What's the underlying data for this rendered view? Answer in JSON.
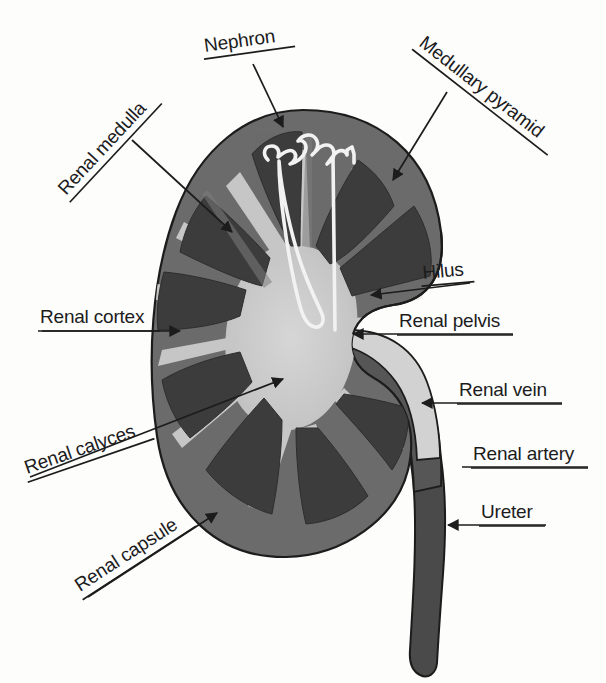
{
  "figure": {
    "type": "anatomical-diagram",
    "background_color": "#fdfdfc"
  },
  "palette": {
    "cortex": "#6b6b6b",
    "medullary_pyramid": "#3c3c3c",
    "renal_pelvis": "#c9c9c9",
    "renal_column": "#7a7a7a",
    "vessel_dark": "#4a4a4a",
    "vessel_light": "#d2d2d2",
    "outline": "#1c1c1c",
    "nephron_outline": "#f2f2f2",
    "label_text": "#1c1c1c",
    "ghost_text": "#efece6"
  },
  "background_ghost_text": [
    {
      "text": "Studies",
      "x": 206,
      "y": 236
    },
    {
      "text": "with Cells",
      "x": 196,
      "y": 300
    },
    {
      "text": "s Cells",
      "x": 200,
      "y": 500
    }
  ],
  "labels": [
    {
      "id": "nephron",
      "text": "Nephron",
      "x": 205,
      "y": 52,
      "rotation": -8,
      "underline_width": 92,
      "anchor": "start",
      "arrow_to_x": 283,
      "arrow_to_y": 127,
      "has_arrow": true
    },
    {
      "id": "medullary-pyramid",
      "text": "Medullary pyramid",
      "x": 418,
      "y": 45,
      "rotation": 38,
      "underline_width": 172,
      "anchor": "start",
      "arrow_to_x": 393,
      "arrow_to_y": 180,
      "has_arrow": true
    },
    {
      "id": "renal-medulla",
      "text": "Renal medulla",
      "x": 66,
      "y": 196,
      "rotation": -47,
      "underline_width": 135,
      "anchor": "start",
      "arrow_to_x": 232,
      "arrow_to_y": 232,
      "has_arrow": true
    },
    {
      "id": "renal-cortex",
      "text": "Renal cortex",
      "x": 40,
      "y": 323,
      "rotation": 0,
      "underline_width": 122,
      "anchor": "start",
      "arrow_to_x": 180,
      "arrow_to_y": 331,
      "has_arrow": true
    },
    {
      "id": "renal-calyces",
      "text": "Renal calyces",
      "x": 27,
      "y": 474,
      "rotation": -19,
      "underline_width": 134,
      "anchor": "start",
      "arrow_to_x": 283,
      "arrow_to_y": 379,
      "has_arrow": true
    },
    {
      "id": "renal-capsule",
      "text": "Renal capsule",
      "x": 80,
      "y": 592,
      "rotation": -33,
      "underline_width": 135,
      "anchor": "start",
      "arrow_to_x": 217,
      "arrow_to_y": 513,
      "has_arrow": true
    },
    {
      "id": "hilus",
      "text": "Hilus",
      "x": 423,
      "y": 279,
      "rotation": -5,
      "underline_width": 53,
      "anchor": "start",
      "arrow_to_x": 371,
      "arrow_to_y": 295,
      "has_arrow": true
    },
    {
      "id": "renal-pelvis",
      "text": "Renal pelvis",
      "x": 399,
      "y": 327,
      "rotation": 0,
      "underline_width": 116,
      "anchor": "start",
      "arrow_to_x": 353,
      "arrow_to_y": 334,
      "has_arrow": true
    },
    {
      "id": "renal-vein",
      "text": "Renal vein",
      "x": 459,
      "y": 396,
      "rotation": 0,
      "underline_width": 105,
      "anchor": "start",
      "arrow_to_x": 422,
      "arrow_to_y": 403,
      "has_arrow": true
    },
    {
      "id": "renal-artery",
      "text": "Renal artery",
      "x": 473,
      "y": 460,
      "rotation": 0,
      "underline_width": 117,
      "anchor": "start",
      "arrow_to_x": 462,
      "arrow_to_y": 467,
      "has_arrow": false
    },
    {
      "id": "ureter",
      "text": "Ureter",
      "x": 481,
      "y": 518,
      "rotation": 0,
      "underline_width": 66,
      "anchor": "start",
      "arrow_to_x": 448,
      "arrow_to_y": 525,
      "has_arrow": true
    }
  ],
  "structures": [
    {
      "id": "renal-capsule-outline",
      "name": "Renal capsule",
      "description": "outer thin boundary of the kidney"
    },
    {
      "id": "renal-cortex-region",
      "name": "Renal cortex",
      "description": "outer mid-grey band of kidney tissue"
    },
    {
      "id": "medullary-pyramids",
      "name": "Medullary pyramids",
      "count": 8,
      "description": "dark triangular wedges pointing inward"
    },
    {
      "id": "renal-pelvis-region",
      "name": "Renal pelvis",
      "description": "light grey central funnel-shaped cavity"
    },
    {
      "id": "renal-calyces-region",
      "name": "Renal calyces",
      "description": "light grey spikes radiating from the pelvis"
    },
    {
      "id": "nephron-outline",
      "name": "Nephron",
      "description": "white outlined tubule in upper pyramid"
    },
    {
      "id": "renal-vein-vessel",
      "name": "Renal vein",
      "description": "light grey vessel exiting the hilus"
    },
    {
      "id": "renal-artery-vessel",
      "name": "Renal artery",
      "description": "dark grey vessel entering the hilus"
    },
    {
      "id": "ureter-tube",
      "name": "Ureter",
      "description": "thick dark tube descending from the pelvis"
    },
    {
      "id": "hilus-notch",
      "name": "Hilus",
      "description": "indentation on the medial border of the kidney"
    }
  ]
}
